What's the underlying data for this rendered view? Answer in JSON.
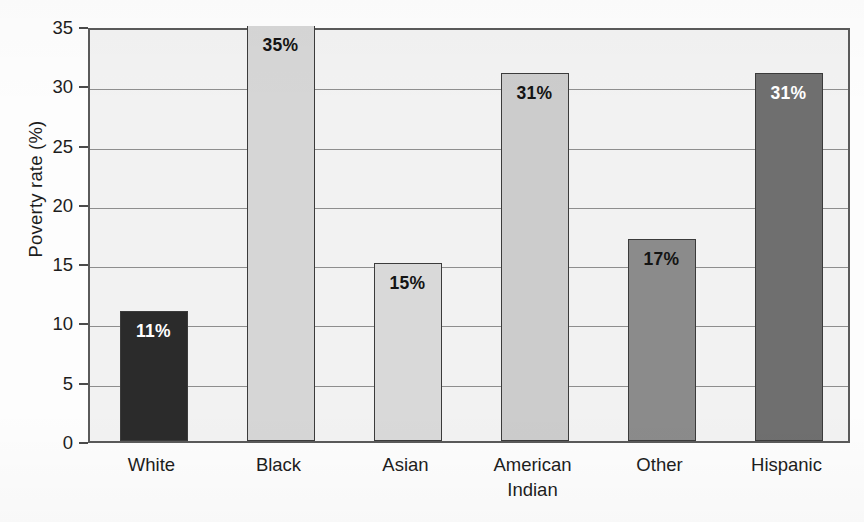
{
  "chart_data": {
    "type": "bar",
    "title": "",
    "subtitle": "",
    "xlabel": "",
    "ylabel": "Poverty rate (%)",
    "ylim": [
      0,
      35
    ],
    "ytick_step": 5,
    "yticks": [
      "0",
      "5",
      "10",
      "15",
      "20",
      "25",
      "30",
      "35"
    ],
    "grid": true,
    "grid_axis": "y",
    "legend": false,
    "legend_position": "none",
    "categories": [
      "White",
      "Black",
      "Asian",
      "American\nIndian",
      "Other",
      "Hispanic"
    ],
    "values": [
      11,
      35,
      15,
      31,
      17,
      31
    ],
    "data_labels": [
      "11%",
      "35%",
      "15%",
      "31%",
      "17%",
      "31%"
    ],
    "bar_colors": [
      "#2b2b2b",
      "#d6d6d6",
      "#d9d9d9",
      "#cccccc",
      "#8b8b8b",
      "#6f6f6f"
    ],
    "bar_label_colors": [
      "#ffffff",
      "#141414",
      "#141414",
      "#141414",
      "#141414",
      "#ffffff"
    ],
    "bar_edge_color": "#3b3b3b",
    "plot_background": "#f2f2f2",
    "gridline_color": "#8e8e8e",
    "axis_color": "#5a5a5a",
    "text_color": "#1d1d1d"
  },
  "axes": {
    "y_title": "Poverty rate (%)"
  }
}
